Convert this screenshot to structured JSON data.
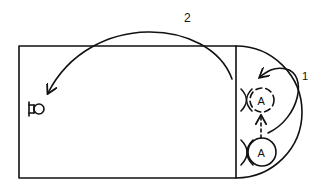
{
  "diagram": {
    "type": "basketball-play-diagram",
    "colors": {
      "ink": "#111111",
      "background": "#ffffff"
    },
    "court": {
      "half_court_rect": {
        "x": 19,
        "y": 46,
        "width": 217,
        "height": 132
      },
      "key_semicircle": {
        "cx": 236,
        "cy": 112,
        "r": 66
      }
    },
    "basket": {
      "name": "basket-icon",
      "x": 36,
      "y": 109
    },
    "players": [
      {
        "label": "A",
        "x": 262,
        "y": 100,
        "r": 12,
        "style": "dashed",
        "note": "new position"
      },
      {
        "label": "A",
        "x": 262,
        "y": 152,
        "r": 14,
        "style": "solid",
        "note": "start position"
      }
    ],
    "paths": [
      {
        "label": "1",
        "type": "cut",
        "label_x": 304,
        "label_y": 80
      },
      {
        "label": "2",
        "type": "pass",
        "label_x": 184,
        "label_y": 22
      }
    ],
    "screens": [
      {
        "x": 246,
        "y": 100
      },
      {
        "x": 247,
        "y": 152
      }
    ]
  }
}
